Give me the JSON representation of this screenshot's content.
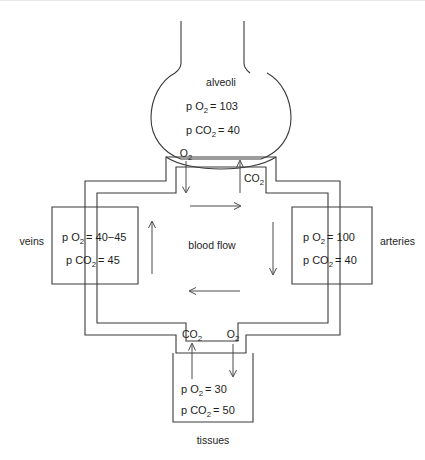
{
  "diagram": {
    "type": "flow-diagram",
    "colors": {
      "stroke": "#3a3a3a",
      "arrow": "#4a4a4a",
      "text": "#1d1d1d",
      "background": "#ffffff"
    }
  },
  "alveoli": {
    "label": "alveoli",
    "po2_prefix": "p O",
    "po2_sub": "2",
    "po2_value": "= 103",
    "pco2_prefix": "p CO",
    "pco2_sub": "2",
    "pco2_value": "= 40",
    "gas_in": "O",
    "gas_in_sub": "2",
    "gas_out": "CO",
    "gas_out_sub": "2",
    "gas_in_direction": "down",
    "gas_out_direction": "up"
  },
  "veins": {
    "label": "veins",
    "po2_prefix": "p O",
    "po2_sub": "2",
    "po2_value": "= 40−45",
    "pco2_prefix": "p CO",
    "pco2_sub": "2",
    "pco2_value": "= 45"
  },
  "arteries": {
    "label": "arteries",
    "po2_prefix": "p O",
    "po2_sub": "2",
    "po2_value": "= 100",
    "pco2_prefix": "p CO",
    "pco2_sub": "2",
    "pco2_value": "= 40"
  },
  "tissues": {
    "label": "tissues",
    "po2_prefix": "p O",
    "po2_sub": "2",
    "po2_value": "= 30",
    "pco2_prefix": "p CO",
    "pco2_sub": "2",
    "pco2_value": "= 50",
    "gas_in": "O",
    "gas_in_sub": "2",
    "gas_out": "CO",
    "gas_out_sub": "2",
    "gas_in_direction": "down",
    "gas_out_direction": "up"
  },
  "circulation": {
    "label": "blood flow",
    "top_arrow_direction": "right",
    "right_arrow_direction": "down",
    "bottom_arrow_direction": "left",
    "left_arrow_direction": "up"
  }
}
